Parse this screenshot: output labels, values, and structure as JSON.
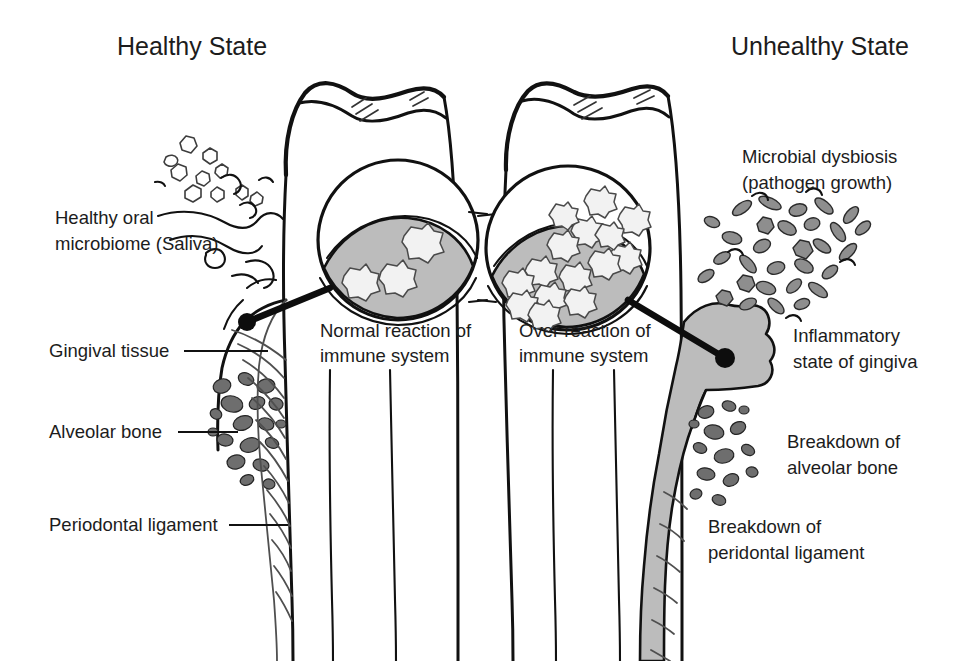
{
  "figure": {
    "kind": "medical-illustration",
    "background_color": "#ffffff",
    "ink_color": "#111111",
    "gray_fill_color": "#bcbcbc"
  },
  "titles": {
    "left": "Healthy State",
    "right": "Unhealthy State"
  },
  "left_labels": {
    "microbiome_line1": "Healthy oral",
    "microbiome_line2": "microbiome (Saliva)",
    "gingival_tissue": "Gingival tissue",
    "alveolar_bone": "Alveolar bone",
    "periodontal_ligament": "Periodontal ligament"
  },
  "callouts": {
    "healthy_line1": "Normal reaction of",
    "healthy_line2": "immune system",
    "unhealthy_line1": "Over reaction of",
    "unhealthy_line2": "immune system"
  },
  "right_labels": {
    "dysbiosis_line1": "Microbial dysbiosis",
    "dysbiosis_line2": "(pathogen growth)",
    "inflammation_line1": "Inflammatory",
    "inflammation_line2": "state of gingiva",
    "bone_breakdown_line1": "Breakdown of",
    "bone_breakdown_line2": "alveolar bone",
    "ligament_breakdown_line1": "Breakdown of",
    "ligament_breakdown_line2": "peridontal ligament"
  },
  "panels": [
    {
      "id": "healthy",
      "title": "Healthy State",
      "microbiome_density": "sparse",
      "microbiome_count": 14,
      "immune_cell_count": 3,
      "gingiva_state": "normal",
      "bone_level": "high",
      "ligament_state": "intact"
    },
    {
      "id": "unhealthy",
      "title": "Unhealthy State",
      "microbiome_density": "dense",
      "microbiome_count": 46,
      "immune_cell_count": 15,
      "gingiva_state": "inflamed-filled",
      "bone_level": "receded",
      "ligament_state": "degraded"
    }
  ]
}
